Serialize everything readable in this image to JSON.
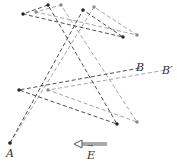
{
  "diagram": {
    "colors": {
      "dark_path": "#3a3a3a",
      "light_path": "#9a9a9a",
      "dot_dark": "#222222",
      "dot_light": "#8a8a8a"
    },
    "labels": {
      "start": "A",
      "end_no_field": "B",
      "end_with_field": "B′",
      "field": "E",
      "field_arrow_mark": "→"
    },
    "path_without_field": [
      [
        10,
        143
      ],
      [
        83,
        10
      ],
      [
        123,
        37
      ],
      [
        23,
        14
      ],
      [
        48,
        5
      ],
      [
        117,
        124
      ],
      [
        19,
        90
      ],
      [
        140,
        68
      ]
    ],
    "path_with_field": [
      [
        10,
        143
      ],
      [
        94,
        7
      ],
      [
        137,
        35
      ],
      [
        36,
        12
      ],
      [
        61,
        5
      ],
      [
        137,
        122
      ],
      [
        48,
        90
      ],
      [
        166,
        70
      ]
    ],
    "field_arrow": {
      "from": [
        107,
        145
      ],
      "to": [
        75,
        145
      ],
      "direction": "left"
    }
  }
}
